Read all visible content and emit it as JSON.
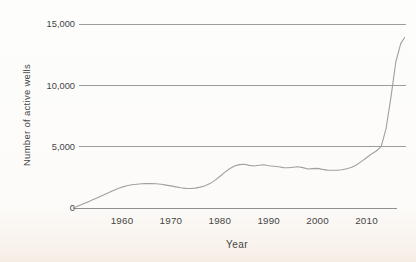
{
  "figure": {
    "text_color": "#454545",
    "grid_color": "#9d9d9d",
    "axis_color": "#8f8f8f",
    "line_color": "#a0a0a0",
    "background": "#fcfbf9"
  },
  "chart_data": {
    "type": "line",
    "title": "",
    "xlabel": "Year",
    "ylabel": "Number of active wells",
    "xlim": [
      1950,
      2018
    ],
    "ylim": [
      0,
      15000
    ],
    "x_ticks": [
      1960,
      1970,
      1980,
      1990,
      2000,
      2010
    ],
    "y_ticks": [
      0,
      5000,
      10000,
      15000
    ],
    "y_tick_labels": [
      "0",
      "5,000",
      "10,000",
      "15,000"
    ],
    "grid": "horizontal",
    "legend": "none",
    "series": [
      {
        "name": "active wells",
        "x": [
          1950,
          1951,
          1952,
          1953,
          1954,
          1955,
          1956,
          1957,
          1958,
          1959,
          1960,
          1961,
          1962,
          1963,
          1964,
          1965,
          1966,
          1967,
          1968,
          1969,
          1970,
          1971,
          1972,
          1973,
          1974,
          1975,
          1976,
          1977,
          1978,
          1979,
          1980,
          1981,
          1982,
          1983,
          1984,
          1985,
          1986,
          1987,
          1988,
          1989,
          1990,
          1991,
          1992,
          1993,
          1994,
          1995,
          1996,
          1997,
          1998,
          1999,
          2000,
          2001,
          2002,
          2003,
          2004,
          2005,
          2006,
          2007,
          2008,
          2009,
          2010,
          2011,
          2012,
          2013,
          2014,
          2015,
          2016,
          2017,
          2017.8
        ],
        "y": [
          0,
          160,
          330,
          500,
          670,
          840,
          1020,
          1200,
          1380,
          1550,
          1700,
          1810,
          1890,
          1940,
          1970,
          1990,
          2000,
          1970,
          1930,
          1870,
          1800,
          1720,
          1650,
          1600,
          1590,
          1620,
          1700,
          1810,
          1990,
          2250,
          2570,
          2900,
          3200,
          3420,
          3540,
          3570,
          3470,
          3420,
          3490,
          3520,
          3450,
          3400,
          3360,
          3290,
          3280,
          3330,
          3370,
          3290,
          3180,
          3210,
          3230,
          3150,
          3090,
          3070,
          3080,
          3120,
          3200,
          3320,
          3520,
          3800,
          4100,
          4400,
          4650,
          5000,
          6500,
          9000,
          11900,
          13400,
          13900
        ]
      }
    ]
  }
}
